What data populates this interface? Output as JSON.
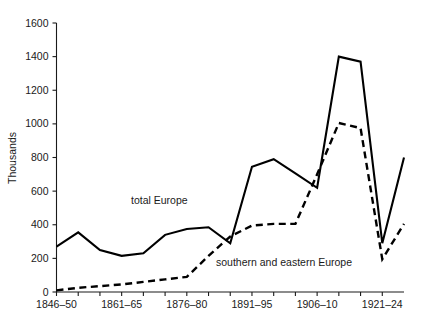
{
  "chart_data": {
    "type": "line",
    "title": "",
    "xlabel": "",
    "ylabel": "Thousands",
    "ylim": [
      0,
      1600
    ],
    "yticks": [
      0,
      200,
      400,
      600,
      800,
      1000,
      1200,
      1400,
      1600
    ],
    "ytick_labels": [
      "0",
      "200",
      "400",
      "600",
      "800",
      "1000",
      "1200",
      "1400",
      "1600"
    ],
    "grid": false,
    "legend_position": "inline-annotations",
    "x": [
      "1846-50",
      "1851-55",
      "1856-60",
      "1861-65",
      "1866-70",
      "1871-75",
      "1876-80",
      "1881-85",
      "1886-90",
      "1891-95",
      "1896-1900",
      "1901-05",
      "1906-10",
      "1911-15",
      "1916-20",
      "1921-24"
    ],
    "xtick_labels": [
      "1846–50",
      "1861–65",
      "1876–80",
      "1891–95",
      "1906–10",
      "1921–24"
    ],
    "xtick_indices": [
      0,
      3,
      6,
      9,
      12,
      15
    ],
    "series": [
      {
        "name": "total Europe",
        "style": "solid",
        "values": [
          270,
          355,
          250,
          215,
          225,
          235,
          295,
          350,
          375,
          385,
          335,
          290,
          620,
          780,
          745,
          680
        ]
      },
      {
        "name": "southern and eastern Europe",
        "style": "dashed",
        "values": [
          5,
          15,
          22,
          30,
          38,
          45,
          55,
          70,
          80,
          88,
          150,
          215,
          330,
          400,
          405,
          405
        ]
      }
    ],
    "annotations": [
      {
        "text": "total Europe",
        "series": "total Europe"
      },
      {
        "text": "southern and eastern Europe",
        "series": "southern and eastern Europe"
      }
    ],
    "note": "Points are plotted at 16 evenly spaced 5-year period slots; solid series peaks at 1400 and dashed series peaks at 1000 in the 1906-10 to 1911-15 range, both collapsing to a deep trough before a final rise."
  },
  "series_paths": {
    "total_europe": [
      [
        0,
        270
      ],
      [
        1,
        355
      ],
      [
        2,
        250
      ],
      [
        3,
        215
      ],
      [
        4,
        230
      ],
      [
        5,
        340
      ],
      [
        6,
        375
      ],
      [
        7,
        385
      ],
      [
        8,
        290
      ],
      [
        9,
        745
      ],
      [
        10,
        790
      ],
      [
        11,
        705
      ],
      [
        12,
        620
      ],
      [
        13,
        1400
      ],
      [
        14,
        1370
      ],
      [
        15,
        290
      ],
      [
        16,
        800
      ]
    ],
    "southern_eastern_europe": [
      [
        0,
        10
      ],
      [
        1,
        25
      ],
      [
        2,
        35
      ],
      [
        3,
        45
      ],
      [
        4,
        60
      ],
      [
        5,
        75
      ],
      [
        6,
        90
      ],
      [
        7,
        215
      ],
      [
        8,
        330
      ],
      [
        9,
        395
      ],
      [
        10,
        405
      ],
      [
        11,
        405
      ],
      [
        12,
        700
      ],
      [
        13,
        1005
      ],
      [
        14,
        975
      ],
      [
        15,
        195
      ],
      [
        16,
        405
      ]
    ]
  },
  "axis": {
    "y_title": "Thousands",
    "y_ticks": [
      "1600",
      "1400",
      "1200",
      "1000",
      "800",
      "600",
      "400",
      "200",
      "0"
    ],
    "x_ticks": [
      "1846–50",
      "1861–65",
      "1876–80",
      "1891–95",
      "1906–10",
      "1921–24"
    ]
  },
  "labels": {
    "total_europe": "total Europe",
    "southern_eastern_europe": "southern and eastern Europe"
  },
  "colors": {
    "ink": "#000000",
    "background": "#ffffff"
  }
}
